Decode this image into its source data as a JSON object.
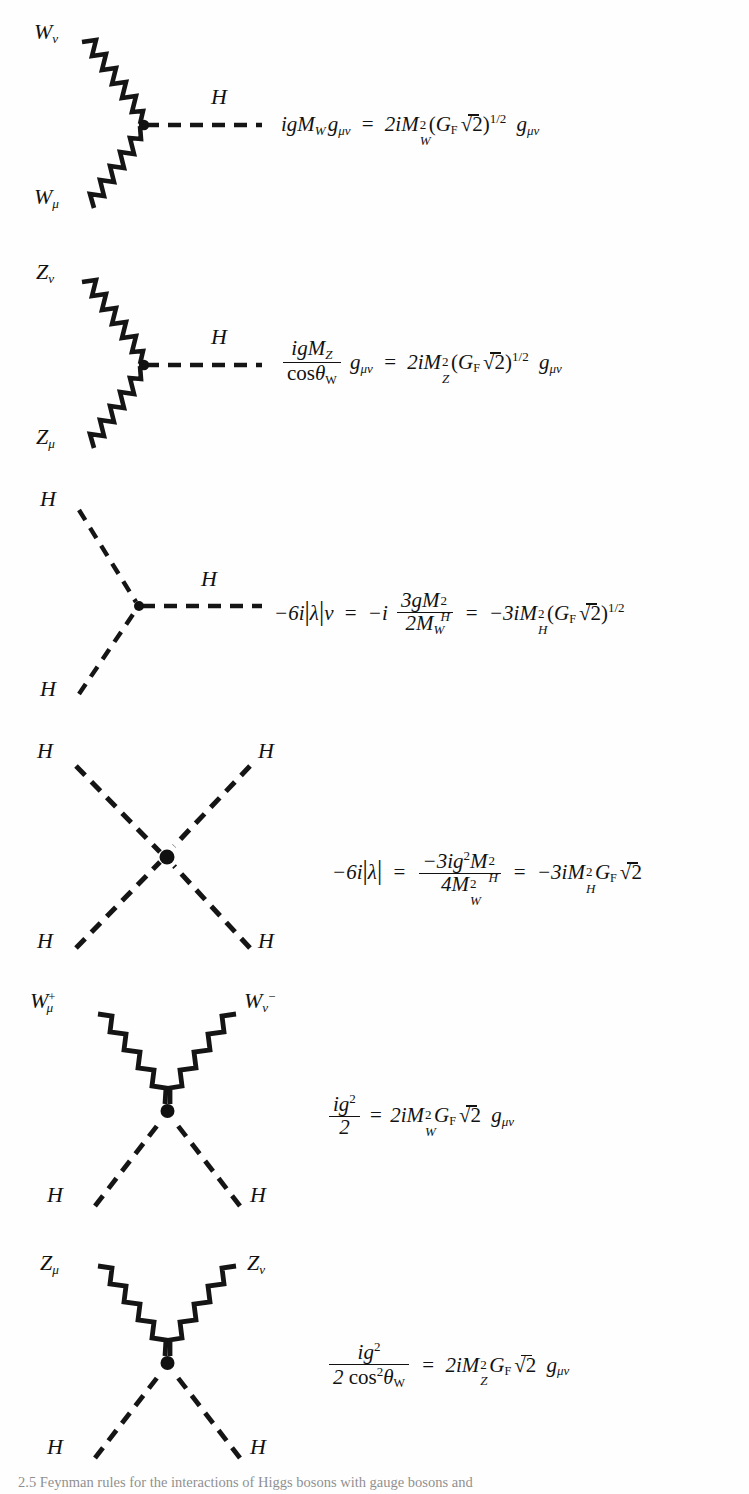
{
  "page": {
    "width": 749,
    "height": 1494,
    "background": "#ffffff",
    "ink": "#141414",
    "caption": "2.5  Feynman rules for the interactions of Higgs bosons with gauge bosons and"
  },
  "diagrams": [
    {
      "id": "hww",
      "name": "higgs-w-w-vertex",
      "type": "three-point",
      "incoming": [
        {
          "label": "W",
          "sub": "ν",
          "sup": "",
          "line": "wavy",
          "position": "upper-left"
        },
        {
          "label": "W",
          "sub": "μ",
          "sup": "",
          "line": "wavy",
          "position": "lower-left"
        }
      ],
      "outgoing": [
        {
          "label": "H",
          "sub": "",
          "sup": "",
          "line": "dashed",
          "position": "right"
        }
      ],
      "equation_text": "igM_W g_{μν} = 2iM_W^2 (G_F√2)^{1/2} g_{μν}"
    },
    {
      "id": "hzz",
      "name": "higgs-z-z-vertex",
      "type": "three-point",
      "incoming": [
        {
          "label": "Z",
          "sub": "ν",
          "sup": "",
          "line": "wavy",
          "position": "upper-left"
        },
        {
          "label": "Z",
          "sub": "μ",
          "sup": "",
          "line": "wavy",
          "position": "lower-left"
        }
      ],
      "outgoing": [
        {
          "label": "H",
          "sub": "",
          "sup": "",
          "line": "dashed",
          "position": "right"
        }
      ],
      "equation_text": "igM_Z / cosθ_W · g_{μν} = 2iM_Z^2 (G_F√2)^{1/2} g_{μν}"
    },
    {
      "id": "hhh",
      "name": "triple-higgs-vertex",
      "type": "three-point",
      "incoming": [
        {
          "label": "H",
          "sub": "",
          "sup": "",
          "line": "dashed",
          "position": "upper-left"
        },
        {
          "label": "H",
          "sub": "",
          "sup": "",
          "line": "dashed",
          "position": "lower-left"
        }
      ],
      "outgoing": [
        {
          "label": "H",
          "sub": "",
          "sup": "",
          "line": "dashed",
          "position": "right"
        }
      ],
      "equation_text": "-6i|λ|v = -i · 3gM_H^2 / 2M_W = -3iM_H^2 (G_F√2)^{1/2}"
    },
    {
      "id": "hhhh",
      "name": "quartic-higgs-vertex",
      "type": "four-point-cross",
      "legs": [
        {
          "label": "H",
          "sub": "",
          "sup": "",
          "line": "dashed",
          "position": "upper-left"
        },
        {
          "label": "H",
          "sub": "",
          "sup": "",
          "line": "dashed",
          "position": "upper-right"
        },
        {
          "label": "H",
          "sub": "",
          "sup": "",
          "line": "dashed",
          "position": "lower-left"
        },
        {
          "label": "H",
          "sub": "",
          "sup": "",
          "line": "dashed",
          "position": "lower-right"
        }
      ],
      "equation_text": "-6i|λ| = -3ig^2M_H^2 / 4M_W^2 = -3iM_H^2 G_F√2"
    },
    {
      "id": "wwhh",
      "name": "w-w-higgs-higgs-vertex",
      "type": "four-point-v",
      "legs": [
        {
          "label": "W",
          "sub": "μ",
          "sup": "+",
          "line": "wavy",
          "position": "upper-left"
        },
        {
          "label": "W",
          "sub": "ν",
          "sup": "−",
          "line": "wavy",
          "position": "upper-right"
        },
        {
          "label": "H",
          "sub": "",
          "sup": "",
          "line": "dashed",
          "position": "lower-left"
        },
        {
          "label": "H",
          "sub": "",
          "sup": "",
          "line": "dashed",
          "position": "lower-right"
        }
      ],
      "equation_text": "ig^2 / 2 = 2iM_W^2 G_F√2 g_{μν}"
    },
    {
      "id": "zzhh",
      "name": "z-z-higgs-higgs-vertex",
      "type": "four-point-v",
      "legs": [
        {
          "label": "Z",
          "sub": "μ",
          "sup": "",
          "line": "wavy",
          "position": "upper-left"
        },
        {
          "label": "Z",
          "sub": "ν",
          "sup": "",
          "line": "wavy",
          "position": "upper-right"
        },
        {
          "label": "H",
          "sub": "",
          "sup": "",
          "line": "dashed",
          "position": "lower-left"
        },
        {
          "label": "H",
          "sub": "",
          "sup": "",
          "line": "dashed",
          "position": "lower-right"
        }
      ],
      "equation_text": "ig^2 / (2 cos^2θ_W) = 2iM_Z^2 G_F√2 g_{μν}"
    }
  ],
  "labels": {
    "W": "W",
    "Z": "Z",
    "H": "H",
    "mu": "μ",
    "nu": "ν",
    "plus": "+",
    "minus": "−"
  },
  "math": {
    "i": "i",
    "g": "g",
    "v": "v",
    "M": "M",
    "G": "G",
    "F": "F",
    "lambda": "λ",
    "theta": "θ",
    "Wsub": "W",
    "Zsub": "Z",
    "Hsub": "H",
    "cos": "cos",
    "eq": "=",
    "two": "2",
    "three": "3",
    "four": "4",
    "six": "6",
    "half": "1/2",
    "neg": "−",
    "bar": "|",
    "gmunu": "g",
    "munu": "μν",
    "sqrt": "√",
    "lp": "(",
    "rp": ")"
  }
}
